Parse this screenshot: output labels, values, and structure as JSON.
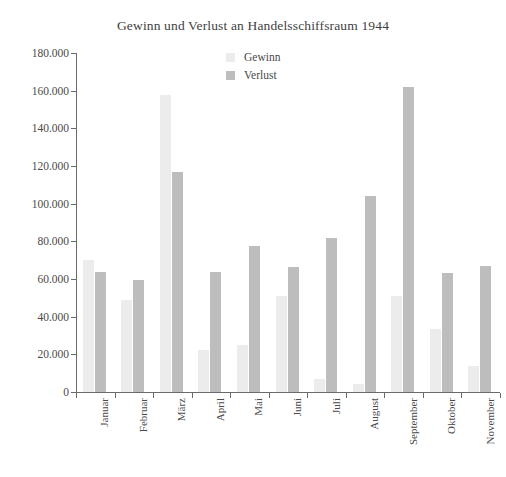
{
  "chart_data": {
    "type": "bar",
    "title": "Gewinn und Verlust an Handelsschiffsraum 1944",
    "xlabel": "",
    "ylabel": "",
    "ylim": [
      0,
      180000
    ],
    "ytick_step": 20000,
    "ytick_labels": [
      "180.000",
      "160.000",
      "140.000",
      "120.000",
      "100.000",
      "80.000",
      "60.000",
      "40.000",
      "20.000",
      "0"
    ],
    "ytick_values": [
      180000,
      160000,
      140000,
      120000,
      100000,
      80000,
      60000,
      40000,
      20000,
      0
    ],
    "grid": false,
    "legend_position": "top-center",
    "categories": [
      "Januar",
      "Februar",
      "März",
      "April",
      "Mai",
      "Juni",
      "Juli",
      "August",
      "September",
      "Oktober",
      "November"
    ],
    "series": [
      {
        "name": "Gewinn",
        "color": "#ececec",
        "values": [
          70000,
          49000,
          157500,
          22500,
          25000,
          51000,
          7000,
          4500,
          51000,
          33500,
          14000
        ]
      },
      {
        "name": "Verlust",
        "color": "#bdbdbd",
        "values": [
          63500,
          59500,
          117000,
          63500,
          77500,
          66500,
          82000,
          104000,
          162000,
          63000,
          67000
        ]
      }
    ]
  },
  "legend": {
    "items": [
      {
        "label": "Gewinn",
        "color": "#ececec"
      },
      {
        "label": "Verlust",
        "color": "#bdbdbd"
      }
    ]
  },
  "colors": {
    "axis": "#6b6b6b",
    "text": "#4a4a4a",
    "background": "#ffffff",
    "gewinn": "#ececec",
    "verlust": "#bdbdbd"
  }
}
